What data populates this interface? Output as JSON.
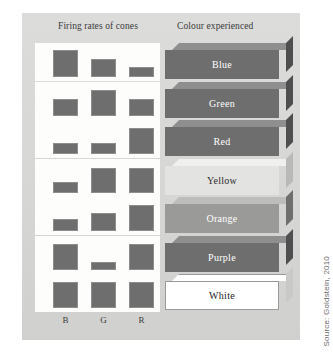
{
  "figure": {
    "headers": {
      "left": "Firing rates of cones",
      "right": "Colour experienced"
    },
    "axis_labels": {
      "b": "B",
      "g": "G",
      "r": "R"
    },
    "source": "Source: Goldstein, 2010",
    "cone_order": [
      "B",
      "G",
      "R"
    ],
    "palette": {
      "panel_background": "#d8d8d6",
      "bar_fill": "#6e6e6e",
      "bar_stroke": "#8d8d8d",
      "strip_background": "#fdfdfc",
      "slab_dark_face": "#6e6e6e",
      "slab_dark_top": "#8f8f8f",
      "slab_dark_side": "#4f4f4f",
      "slab_mid_face": "#9a9a98",
      "slab_light_face": "#e3e3e1",
      "slab_white_face": "#ffffff",
      "label_light_text": "#ffffff",
      "label_dark_text": "#2b2b2b"
    },
    "rows": [
      {
        "label": "Blue",
        "slab_style": "dark",
        "bars": [
          {
            "cone": "B",
            "level": "high",
            "height": 27
          },
          {
            "cone": "G",
            "level": "medium",
            "height": 18
          },
          {
            "cone": "R",
            "level": "low",
            "height": 10
          }
        ]
      },
      {
        "label": "Green",
        "slab_style": "dark",
        "bars": [
          {
            "cone": "B",
            "level": "medium",
            "height": 17
          },
          {
            "cone": "G",
            "level": "high",
            "height": 26
          },
          {
            "cone": "R",
            "level": "medium",
            "height": 17
          }
        ]
      },
      {
        "label": "Red",
        "slab_style": "dark",
        "bars": [
          {
            "cone": "B",
            "level": "low",
            "height": 11
          },
          {
            "cone": "G",
            "level": "low",
            "height": 11
          },
          {
            "cone": "R",
            "level": "high",
            "height": 26
          }
        ]
      },
      {
        "label": "Yellow",
        "slab_style": "light",
        "bars": [
          {
            "cone": "B",
            "level": "low",
            "height": 11
          },
          {
            "cone": "G",
            "level": "high",
            "height": 25
          },
          {
            "cone": "R",
            "level": "high",
            "height": 25
          }
        ]
      },
      {
        "label": "Orange",
        "slab_style": "mid",
        "bars": [
          {
            "cone": "B",
            "level": "low",
            "height": 12
          },
          {
            "cone": "G",
            "level": "medium",
            "height": 18
          },
          {
            "cone": "R",
            "level": "high",
            "height": 26
          }
        ]
      },
      {
        "label": "Purple",
        "slab_style": "dark",
        "bars": [
          {
            "cone": "B",
            "level": "high",
            "height": 26
          },
          {
            "cone": "G",
            "level": "verylow",
            "height": 8
          },
          {
            "cone": "R",
            "level": "high",
            "height": 26
          }
        ]
      },
      {
        "label": "White",
        "slab_style": "white",
        "bars": [
          {
            "cone": "B",
            "level": "high",
            "height": 26
          },
          {
            "cone": "G",
            "level": "high",
            "height": 26
          },
          {
            "cone": "R",
            "level": "high",
            "height": 26
          }
        ]
      }
    ]
  }
}
